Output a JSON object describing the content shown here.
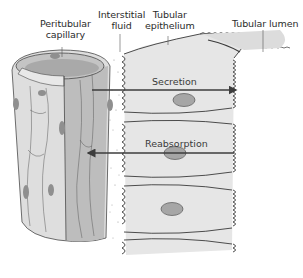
{
  "diagram": {
    "type": "anatomical-illustration",
    "labels": {
      "peritubular_capillary_line1": "Peritubular",
      "peritubular_capillary_line2": "capillary",
      "interstitial_fluid_line1": "Interstitial",
      "interstitial_fluid_line2": "fluid",
      "tubular_epithelium_line1": "Tubular",
      "tubular_epithelium_line2": "epithelium",
      "tubular_lumen": "Tubular lumen"
    },
    "arrows": [
      {
        "label": "Secretion",
        "direction": "capillary-to-lumen (left to right)"
      },
      {
        "label": "Reabsorption",
        "direction": "lumen-to-capillary (right to left)"
      }
    ],
    "colors": {
      "capillary_fill": "#d9d9d9",
      "capillary_inner": "#b8b8b8",
      "cell_fill": "#e4e4e4",
      "nucleus_fill": "#a6a6a6",
      "outline": "#3a3a3a",
      "arrow": "#3c3c3c"
    }
  }
}
